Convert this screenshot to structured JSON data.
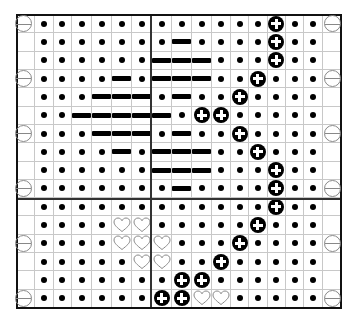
{
  "chart_data": {
    "type": "table",
    "title": "",
    "columns": 17,
    "rows": 16,
    "divider_after_column": 6,
    "divider_after_row": 9,
    "grid": [
      [
        "e",
        ".",
        ".",
        ".",
        ".",
        ".",
        ".",
        ".",
        ".",
        ".",
        ".",
        ".",
        ".",
        "+",
        ".",
        ".",
        "e"
      ],
      [
        "_",
        ".",
        ".",
        ".",
        ".",
        ".",
        ".",
        ".",
        "-",
        ".",
        ".",
        ".",
        ".",
        "+",
        ".",
        ".",
        "_"
      ],
      [
        "_",
        ".",
        ".",
        ".",
        ".",
        ".",
        ".",
        "-",
        "-",
        "-",
        ".",
        ".",
        ".",
        "+",
        ".",
        ".",
        "_"
      ],
      [
        "e",
        ".",
        ".",
        ".",
        ".",
        "-",
        ".",
        "-",
        "-",
        "-",
        ".",
        ".",
        "+",
        ".",
        ".",
        ".",
        "e"
      ],
      [
        "_",
        ".",
        ".",
        ".",
        "-",
        "-",
        "-",
        ".",
        "-",
        ".",
        ".",
        "+",
        ".",
        ".",
        ".",
        ".",
        "_"
      ],
      [
        "_",
        ".",
        ".",
        "-",
        "-",
        "-",
        "-",
        "-",
        ".",
        "+",
        "+",
        ".",
        ".",
        ".",
        ".",
        ".",
        "_"
      ],
      [
        "e",
        ".",
        ".",
        ".",
        "-",
        "-",
        "-",
        ".",
        "-",
        ".",
        ".",
        "+",
        ".",
        ".",
        ".",
        ".",
        "e"
      ],
      [
        "_",
        ".",
        ".",
        ".",
        ".",
        "-",
        ".",
        "-",
        "-",
        "-",
        ".",
        ".",
        "+",
        ".",
        ".",
        ".",
        "_"
      ],
      [
        "_",
        ".",
        ".",
        ".",
        ".",
        ".",
        ".",
        "-",
        "-",
        "-",
        ".",
        ".",
        ".",
        "+",
        ".",
        ".",
        "_"
      ],
      [
        "e",
        ".",
        ".",
        ".",
        ".",
        ".",
        ".",
        ".",
        "-",
        ".",
        ".",
        ".",
        ".",
        "+",
        ".",
        ".",
        "e"
      ],
      [
        "_",
        ".",
        ".",
        ".",
        ".",
        ".",
        ".",
        ".",
        ".",
        ".",
        ".",
        ".",
        ".",
        "+",
        ".",
        ".",
        "_"
      ],
      [
        "_",
        ".",
        ".",
        ".",
        ".",
        "h",
        "h",
        ".",
        ".",
        ".",
        ".",
        ".",
        "+",
        ".",
        ".",
        ".",
        "_"
      ],
      [
        "e",
        ".",
        ".",
        ".",
        ".",
        "h",
        "h",
        "h",
        ".",
        ".",
        ".",
        "+",
        ".",
        ".",
        ".",
        ".",
        "e"
      ],
      [
        "_",
        ".",
        ".",
        ".",
        ".",
        ".",
        "h",
        "h",
        ".",
        ".",
        "+",
        ".",
        ".",
        ".",
        ".",
        ".",
        "_"
      ],
      [
        "_",
        ".",
        ".",
        ".",
        ".",
        ".",
        ".",
        ".",
        "+",
        "+",
        ".",
        ".",
        ".",
        ".",
        ".",
        ".",
        "_"
      ],
      [
        "e",
        ".",
        ".",
        ".",
        ".",
        ".",
        ".",
        "+",
        "+",
        "h",
        "h",
        ".",
        ".",
        ".",
        ".",
        ".",
        "e"
      ]
    ],
    "legend": {
      ".": "dot",
      "-": "dash",
      "+": "plus-circle",
      "h": "heart",
      "e": "edge-circle-minus",
      "_": "blank"
    }
  },
  "colors": {
    "symbol": "#000000",
    "gridline": "#c8c8c8",
    "border": "#111111",
    "edge_symbol": "#888888",
    "heart_outline": "#888888"
  }
}
